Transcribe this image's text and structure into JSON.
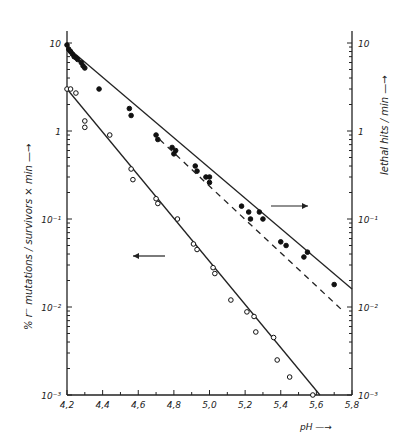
{
  "chart_data": {
    "type": "scatter",
    "title": "",
    "xlabel": "pH",
    "ylabel_left": "% r⁻ mutations / survivors × min",
    "ylabel_right": "lethal hits / min",
    "xlim": [
      4.2,
      5.8
    ],
    "ylim_left": [
      0.001,
      10
    ],
    "ylim_right": [
      0.001,
      10
    ],
    "yscale": "log",
    "grid": false,
    "x_ticks": [
      "4,2",
      "4,4",
      "4,6",
      "4,8",
      "5,0",
      "5,2",
      "5,4",
      "5,6",
      "5,8"
    ],
    "y_ticks_left": [
      "10",
      "1",
      "10⁻¹",
      "10⁻²",
      "10⁻³"
    ],
    "y_ticks_right": [
      "10",
      "1",
      "10⁻¹",
      "10⁻²",
      "10⁻³"
    ],
    "series": [
      {
        "name": "lethal hits / min (filled circles, right axis)",
        "marker": "filled",
        "x": [
          4.2,
          4.21,
          4.22,
          4.23,
          4.24,
          4.25,
          4.26,
          4.28,
          4.29,
          4.3,
          4.38,
          4.55,
          4.56,
          4.7,
          4.71,
          4.79,
          4.8,
          4.81,
          4.92,
          4.93,
          4.98,
          5.0,
          5.0,
          5.18,
          5.22,
          5.23,
          5.28,
          5.3,
          5.4,
          5.43,
          5.53,
          5.55,
          5.7
        ],
        "y": [
          9.5,
          8.5,
          8.0,
          7.5,
          7.0,
          6.8,
          6.5,
          6.0,
          5.5,
          5.2,
          3.0,
          1.8,
          1.5,
          0.9,
          0.8,
          0.65,
          0.55,
          0.6,
          0.4,
          0.35,
          0.3,
          0.3,
          0.26,
          0.14,
          0.12,
          0.1,
          0.12,
          0.1,
          0.055,
          0.05,
          0.037,
          0.042,
          0.018
        ],
        "fit_line": {
          "x": [
            4.2,
            5.8
          ],
          "y": [
            9.0,
            0.016
          ]
        }
      },
      {
        "name": "% r⁻ mutations / survivors × min (open circles, left axis)",
        "marker": "open",
        "x": [
          4.2,
          4.22,
          4.25,
          4.3,
          4.3,
          4.44,
          4.56,
          4.57,
          4.7,
          4.71,
          4.82,
          4.91,
          4.93,
          5.02,
          5.03,
          5.12,
          5.21,
          5.25,
          5.26,
          5.36,
          5.38
        ],
        "y": [
          3.0,
          3.0,
          2.7,
          1.3,
          1.1,
          0.9,
          0.37,
          0.28,
          0.17,
          0.15,
          0.1,
          0.052,
          0.045,
          0.028,
          0.024,
          0.012,
          0.0088,
          0.0078,
          0.0052,
          0.0045,
          0.0025
        ],
        "fit_line": {
          "x": [
            4.2,
            5.62
          ],
          "y": [
            3.0,
            0.001
          ]
        }
      },
      {
        "name": "extrapolation (dashed)",
        "style": "dashed",
        "fit_line": {
          "x": [
            4.72,
            5.75
          ],
          "y": [
            0.8,
            0.009
          ]
        }
      }
    ],
    "annotations": [
      {
        "text": "→",
        "meaning": "filled points refer to right axis",
        "x": 5.3,
        "y": 0.17
      },
      {
        "text": "←",
        "meaning": "open points refer to left axis",
        "x": 4.55,
        "y": 0.04
      }
    ],
    "extra_open_points": [
      {
        "x": 5.45,
        "y": 0.0016
      },
      {
        "x": 5.58,
        "y": 0.001
      }
    ]
  },
  "labels": {
    "left_axis": "% r⁻ mutations / survivors × min —→",
    "right_axis": "lethal   hits / min —→",
    "x_axis": "pH —→"
  }
}
